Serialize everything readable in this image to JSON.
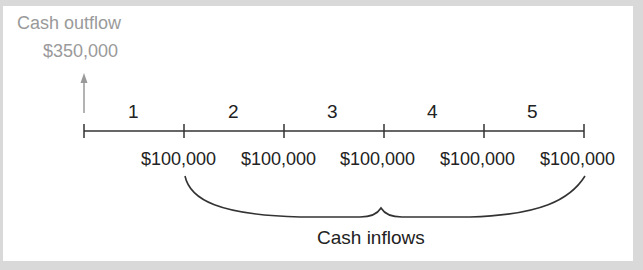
{
  "outflow": {
    "label": "Cash outflow",
    "amount": "$350,000",
    "color": "#9a9a9a"
  },
  "timeline": {
    "periods": [
      "1",
      "2",
      "3",
      "4",
      "5"
    ],
    "tick_count": 6
  },
  "inflows": {
    "amounts": [
      "$100,000",
      "$100,000",
      "$100,000",
      "$100,000",
      "$100,000"
    ],
    "caption": "Cash inflows"
  },
  "colors": {
    "line": "#333333",
    "arrow": "#9a9a9a",
    "background_frame": "#d9d9d9",
    "panel": "#ffffff"
  }
}
